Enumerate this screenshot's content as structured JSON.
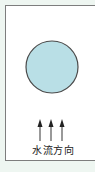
{
  "diagram": {
    "background_color": "#eef6f1",
    "frame_color": "#7d7d7d",
    "circle": {
      "fill": "#b9dfe6",
      "stroke": "#4a4a4a",
      "cx": 52,
      "cy": 67,
      "r": 26
    },
    "arrows": {
      "count": 3,
      "x_positions": [
        40,
        51,
        62
      ],
      "direction": "up",
      "color": "#333333"
    },
    "flow_label": "水流方向"
  }
}
